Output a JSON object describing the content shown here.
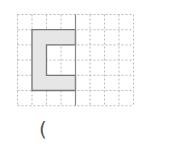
{
  "figure": {
    "type": "grid-symmetry-figure",
    "grid": {
      "columns": 8,
      "rows": 6
    },
    "axis_of_symmetry": {
      "orientation": "vertical",
      "at_column_line": 4
    },
    "shape": {
      "description": "C-shaped shaded polygon on left side of axis",
      "fill": "#e6e6e6",
      "stroke": "#777777",
      "outer_cells": {
        "col_start": 1,
        "col_end": 4,
        "row_start": 1,
        "row_end": 5
      },
      "inner_cut_cells": {
        "col_start": 2,
        "col_end": 4,
        "row_start": 2,
        "row_end": 4
      }
    },
    "colors": {
      "grid_line": "#bbbbbb",
      "axis_line": "#888888"
    }
  },
  "answer_blank": {
    "open_paren": "("
  }
}
